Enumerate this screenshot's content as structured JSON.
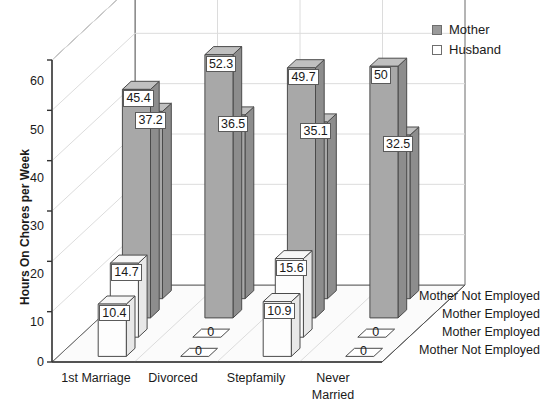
{
  "chart_data": {
    "type": "bar",
    "title": "",
    "xlabel": "",
    "ylabel": "Hours On Chores per Week",
    "ylim": [
      0,
      60
    ],
    "yticks": [
      "0",
      "10",
      "20",
      "30",
      "40",
      "50",
      "60"
    ],
    "grid": true,
    "projection": "3d",
    "legend_position": "top-right",
    "categories": [
      "1st Marriage",
      "Divorced",
      "Stepfamily",
      "Never Married"
    ],
    "depth_categories": [
      "Mother Not Employed",
      "Mother Employed",
      "Mother Employed",
      "Mother Not Employed"
    ],
    "legend": [
      {
        "label": "Mother",
        "swatch": "mother"
      },
      {
        "label": "Husband",
        "swatch": "husband"
      }
    ],
    "series": [
      {
        "name": "Mother Not Employed",
        "group": "Mother",
        "values": [
          37.2,
          36.5,
          35.1,
          32.5
        ]
      },
      {
        "name": "Mother Employed",
        "group": "Mother",
        "values": [
          45.4,
          52.3,
          49.7,
          50
        ]
      },
      {
        "name": "Mother Employed",
        "group": "Husband",
        "values": [
          14.7,
          0,
          15.6,
          0
        ]
      },
      {
        "name": "Mother Not Employed",
        "group": "Husband",
        "values": [
          10.4,
          0,
          10.9,
          0
        ]
      }
    ],
    "value_labels": [
      "37.2",
      "45.4",
      "14.7",
      "10.4",
      "36.5",
      "52.3",
      "0",
      "0",
      "35.1",
      "49.7",
      "15.6",
      "10.9",
      "32.5",
      "50",
      "0",
      "0"
    ]
  },
  "colors": {
    "mother_front": "#a8a8a8",
    "mother_side": "#8d8d8d",
    "mother_top": "#c0c0c0",
    "husband_front": "#fdfdfd",
    "husband_side": "#e8e8e8",
    "husband_top": "#f6f6f6",
    "outline": "#4a4a4a",
    "grid": "#dcdcdc",
    "frame": "#6b6b6b",
    "floor": "#fbfbfb",
    "wall": "#ffffff"
  },
  "xticks": [
    {
      "line1": "1st Marriage",
      "line2": ""
    },
    {
      "line1": "Divorced",
      "line2": ""
    },
    {
      "line1": "Stepfamily",
      "line2": ""
    },
    {
      "line1": "Never",
      "line2": "Married"
    }
  ],
  "yticks": [
    {
      "v": "60"
    },
    {
      "v": "50"
    },
    {
      "v": "40"
    },
    {
      "v": "30"
    },
    {
      "v": "20"
    },
    {
      "v": "10"
    },
    {
      "v": "0"
    }
  ],
  "depth_labels": [
    {
      "t": "Mother Not Employed"
    },
    {
      "t": "Mother Employed"
    },
    {
      "t": "Mother Employed"
    },
    {
      "t": "Mother Not Employed"
    }
  ],
  "ytitle": "Hours On Chores per Week",
  "legend": [
    {
      "label": "Mother"
    },
    {
      "label": "Husband"
    }
  ]
}
